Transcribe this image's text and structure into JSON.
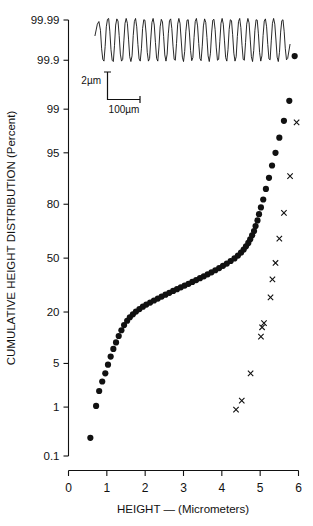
{
  "chart_data": {
    "type": "scatter",
    "title": "",
    "xlabel": "HEIGHT — (Micrometers)",
    "ylabel": "CUMULATIVE HEIGHT DISTRIBUTION (Percent)",
    "xlim": [
      0,
      6
    ],
    "xticks": [
      0,
      1,
      2,
      3,
      4,
      5,
      6
    ],
    "xticklabels": [
      "0",
      "1",
      "2",
      "3",
      "4",
      "5",
      "6"
    ],
    "yscale": "probability",
    "yticks": [
      0.1,
      1,
      5,
      20,
      50,
      80,
      95,
      99,
      99.9,
      99.99
    ],
    "yticklabels": [
      "0.1",
      "1",
      "5",
      "20",
      "50",
      "80",
      "95",
      "99",
      "99.9",
      "99.99"
    ],
    "grid": false,
    "legend": null,
    "series": [
      {
        "name": "cumulative-height-distribution",
        "marker": "filled-circle",
        "points": [
          [
            0.57,
            0.25
          ],
          [
            0.72,
            1.05
          ],
          [
            0.8,
            1.9
          ],
          [
            0.88,
            2.7
          ],
          [
            0.96,
            3.6
          ],
          [
            1.03,
            4.8
          ],
          [
            1.1,
            6.2
          ],
          [
            1.17,
            7.8
          ],
          [
            1.24,
            9.4
          ],
          [
            1.31,
            11.2
          ],
          [
            1.38,
            13.0
          ],
          [
            1.45,
            14.8
          ],
          [
            1.53,
            16.4
          ],
          [
            1.6,
            17.8
          ],
          [
            1.68,
            19.0
          ],
          [
            1.76,
            20.2
          ],
          [
            1.85,
            21.3
          ],
          [
            1.94,
            22.4
          ],
          [
            2.03,
            23.4
          ],
          [
            2.13,
            24.4
          ],
          [
            2.23,
            25.4
          ],
          [
            2.33,
            26.4
          ],
          [
            2.43,
            27.4
          ],
          [
            2.53,
            28.4
          ],
          [
            2.63,
            29.4
          ],
          [
            2.73,
            30.4
          ],
          [
            2.83,
            31.4
          ],
          [
            2.93,
            32.4
          ],
          [
            3.03,
            33.4
          ],
          [
            3.13,
            34.4
          ],
          [
            3.23,
            35.5
          ],
          [
            3.33,
            36.6
          ],
          [
            3.43,
            37.7
          ],
          [
            3.53,
            38.8
          ],
          [
            3.63,
            40.0
          ],
          [
            3.73,
            41.2
          ],
          [
            3.83,
            42.5
          ],
          [
            3.93,
            43.8
          ],
          [
            4.03,
            45.2
          ],
          [
            4.13,
            46.6
          ],
          [
            4.23,
            48.2
          ],
          [
            4.33,
            49.8
          ],
          [
            4.42,
            51.6
          ],
          [
            4.5,
            53.4
          ],
          [
            4.57,
            55.3
          ],
          [
            4.63,
            57.3
          ],
          [
            4.69,
            59.4
          ],
          [
            4.74,
            61.6
          ],
          [
            4.79,
            63.9
          ],
          [
            4.84,
            66.4
          ],
          [
            4.88,
            69.2
          ],
          [
            4.93,
            72.2
          ],
          [
            4.97,
            75.4
          ],
          [
            5.02,
            78.6
          ],
          [
            5.08,
            82.0
          ],
          [
            5.15,
            86.0
          ],
          [
            5.23,
            89.5
          ],
          [
            5.31,
            92.6
          ],
          [
            5.4,
            95.0
          ],
          [
            5.5,
            97.0
          ],
          [
            5.62,
            98.4
          ],
          [
            5.76,
            99.3
          ],
          [
            5.9,
            99.92
          ]
        ]
      },
      {
        "name": "secondary-distribution",
        "marker": "cross-x",
        "points": [
          [
            4.37,
            0.9
          ],
          [
            4.52,
            1.3
          ],
          [
            4.75,
            3.6
          ],
          [
            5.02,
            11.0
          ],
          [
            5.05,
            14.0
          ],
          [
            5.1,
            15.5
          ],
          [
            5.27,
            27.0
          ],
          [
            5.32,
            37.0
          ],
          [
            5.4,
            47.0
          ],
          [
            5.5,
            62.0
          ],
          [
            5.62,
            76.0
          ],
          [
            5.78,
            90.0
          ],
          [
            5.95,
            98.3
          ]
        ]
      }
    ],
    "inset": {
      "name": "surface-profile-trace",
      "vertical_scale_label": "2µm",
      "horizontal_scale_label": "100µm",
      "waveform_cycles": 22,
      "trace": [
        [
          0.0,
          0.6
        ],
        [
          0.012,
          0.86
        ],
        [
          0.02,
          0.92
        ],
        [
          0.028,
          0.72
        ],
        [
          0.034,
          0.3
        ],
        [
          0.04,
          0.06
        ],
        [
          0.046,
          0.02
        ],
        [
          0.052,
          0.35
        ],
        [
          0.058,
          0.8
        ],
        [
          0.064,
          0.97
        ],
        [
          0.07,
          0.99
        ],
        [
          0.076,
          0.7
        ],
        [
          0.082,
          0.28
        ],
        [
          0.088,
          0.04
        ],
        [
          0.094,
          0.01
        ],
        [
          0.1,
          0.38
        ],
        [
          0.106,
          0.84
        ],
        [
          0.112,
          0.98
        ],
        [
          0.118,
          0.93
        ],
        [
          0.124,
          0.6
        ],
        [
          0.13,
          0.18
        ],
        [
          0.136,
          0.02
        ],
        [
          0.142,
          0.06
        ],
        [
          0.148,
          0.48
        ],
        [
          0.154,
          0.88
        ],
        [
          0.16,
          0.99
        ],
        [
          0.166,
          0.88
        ],
        [
          0.172,
          0.52
        ],
        [
          0.178,
          0.12
        ],
        [
          0.184,
          0.01
        ],
        [
          0.19,
          0.14
        ],
        [
          0.196,
          0.6
        ],
        [
          0.202,
          0.92
        ],
        [
          0.208,
          0.99
        ],
        [
          0.214,
          0.8
        ],
        [
          0.22,
          0.4
        ],
        [
          0.226,
          0.07
        ],
        [
          0.232,
          0.02
        ],
        [
          0.238,
          0.3
        ],
        [
          0.244,
          0.76
        ],
        [
          0.25,
          0.96
        ],
        [
          0.256,
          0.95
        ],
        [
          0.262,
          0.66
        ],
        [
          0.268,
          0.22
        ],
        [
          0.274,
          0.02
        ],
        [
          0.28,
          0.08
        ],
        [
          0.286,
          0.52
        ],
        [
          0.292,
          0.9
        ],
        [
          0.298,
          0.99
        ],
        [
          0.304,
          0.84
        ],
        [
          0.31,
          0.44
        ],
        [
          0.316,
          0.08
        ],
        [
          0.322,
          0.02
        ],
        [
          0.328,
          0.34
        ],
        [
          0.334,
          0.8
        ],
        [
          0.34,
          0.97
        ],
        [
          0.346,
          0.91
        ],
        [
          0.352,
          0.58
        ],
        [
          0.358,
          0.16
        ],
        [
          0.364,
          0.02
        ],
        [
          0.37,
          0.18
        ],
        [
          0.376,
          0.64
        ],
        [
          0.382,
          0.94
        ],
        [
          0.388,
          0.98
        ],
        [
          0.394,
          0.76
        ],
        [
          0.4,
          0.36
        ],
        [
          0.406,
          0.06
        ],
        [
          0.412,
          0.04
        ],
        [
          0.418,
          0.42
        ],
        [
          0.424,
          0.86
        ],
        [
          0.43,
          0.99
        ],
        [
          0.436,
          0.88
        ],
        [
          0.442,
          0.5
        ],
        [
          0.448,
          0.11
        ],
        [
          0.454,
          0.01
        ],
        [
          0.46,
          0.24
        ],
        [
          0.466,
          0.7
        ],
        [
          0.472,
          0.95
        ],
        [
          0.478,
          0.96
        ],
        [
          0.484,
          0.68
        ],
        [
          0.49,
          0.26
        ],
        [
          0.496,
          0.03
        ],
        [
          0.502,
          0.1
        ],
        [
          0.508,
          0.56
        ],
        [
          0.514,
          0.92
        ],
        [
          0.52,
          0.99
        ],
        [
          0.526,
          0.82
        ],
        [
          0.532,
          0.42
        ],
        [
          0.538,
          0.08
        ],
        [
          0.544,
          0.03
        ],
        [
          0.55,
          0.36
        ],
        [
          0.556,
          0.82
        ],
        [
          0.562,
          0.98
        ],
        [
          0.568,
          0.9
        ],
        [
          0.574,
          0.56
        ],
        [
          0.58,
          0.14
        ],
        [
          0.586,
          0.01
        ],
        [
          0.592,
          0.2
        ],
        [
          0.598,
          0.66
        ],
        [
          0.604,
          0.95
        ],
        [
          0.61,
          0.97
        ],
        [
          0.616,
          0.74
        ],
        [
          0.622,
          0.32
        ],
        [
          0.628,
          0.04
        ],
        [
          0.634,
          0.06
        ],
        [
          0.64,
          0.46
        ],
        [
          0.646,
          0.88
        ],
        [
          0.652,
          0.99
        ],
        [
          0.658,
          0.86
        ],
        [
          0.664,
          0.48
        ],
        [
          0.67,
          0.1
        ],
        [
          0.676,
          0.02
        ],
        [
          0.682,
          0.28
        ],
        [
          0.688,
          0.74
        ],
        [
          0.694,
          0.96
        ],
        [
          0.7,
          0.94
        ],
        [
          0.706,
          0.62
        ],
        [
          0.712,
          0.2
        ],
        [
          0.718,
          0.02
        ],
        [
          0.724,
          0.12
        ],
        [
          0.73,
          0.58
        ],
        [
          0.736,
          0.92
        ],
        [
          0.742,
          0.99
        ],
        [
          0.748,
          0.78
        ],
        [
          0.754,
          0.38
        ],
        [
          0.76,
          0.06
        ],
        [
          0.766,
          0.04
        ],
        [
          0.772,
          0.44
        ],
        [
          0.778,
          0.86
        ],
        [
          0.784,
          0.99
        ],
        [
          0.79,
          0.89
        ],
        [
          0.796,
          0.52
        ],
        [
          0.802,
          0.12
        ],
        [
          0.808,
          0.01
        ],
        [
          0.814,
          0.26
        ],
        [
          0.82,
          0.72
        ],
        [
          0.826,
          0.96
        ],
        [
          0.832,
          0.95
        ],
        [
          0.838,
          0.64
        ],
        [
          0.844,
          0.22
        ],
        [
          0.85,
          0.02
        ],
        [
          0.856,
          0.14
        ],
        [
          0.862,
          0.6
        ],
        [
          0.868,
          0.93
        ],
        [
          0.874,
          0.98
        ],
        [
          0.88,
          0.8
        ],
        [
          0.886,
          0.4
        ],
        [
          0.892,
          0.07
        ],
        [
          0.898,
          0.05
        ],
        [
          0.904,
          0.48
        ],
        [
          0.91,
          0.88
        ],
        [
          0.916,
          0.99
        ],
        [
          0.922,
          0.86
        ],
        [
          0.928,
          0.5
        ],
        [
          0.934,
          0.11
        ],
        [
          0.94,
          0.01
        ],
        [
          0.946,
          0.22
        ],
        [
          0.952,
          0.68
        ],
        [
          0.958,
          0.94
        ],
        [
          0.964,
          0.96
        ],
        [
          0.97,
          0.7
        ],
        [
          0.976,
          0.3
        ],
        [
          0.982,
          0.05
        ],
        [
          0.988,
          0.08
        ],
        [
          1.0,
          0.4
        ]
      ]
    }
  },
  "figure": {
    "y_axis_title": "CUMULATIVE HEIGHT DISTRIBUTION (Percent)",
    "x_axis_title": "HEIGHT — (Micrometers)",
    "scale_vertical": "2µm",
    "scale_horizontal": "100µm"
  }
}
